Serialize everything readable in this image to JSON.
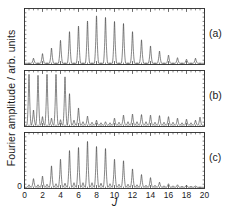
{
  "figure": {
    "ylabel": "Fourier amplitude / arb. units",
    "xlabel": "J",
    "panel_tags": [
      "(a)",
      "(b)",
      "(c)"
    ]
  },
  "chart_data": {
    "type": "line",
    "title": "",
    "xlabel": "J",
    "ylabel": "Fourier amplitude / arb. units",
    "xlim": [
      0,
      20
    ],
    "xticks": [
      0,
      2,
      4,
      6,
      8,
      10,
      12,
      14,
      16,
      18,
      20
    ],
    "xtick_labels": [
      "0",
      "2",
      "4",
      "6",
      "8",
      "10",
      "12",
      "14",
      "16",
      "18",
      "20"
    ],
    "xminor_tick_interval": 0.5,
    "ylim": [
      0,
      1
    ],
    "yticks_visible": false,
    "grid": false,
    "legend": false,
    "tick_direction": "in",
    "line_color": "#3a3a3a",
    "frame_color": "#2b2b2b",
    "background": "#ffffff",
    "peak_half_width": 0.075,
    "panels": [
      {
        "label": "(a)",
        "description": "Bell-shaped rotational distribution peaking near J=8-9, tall narrow peaks at integer J.",
        "x": [
          1,
          2,
          3,
          4,
          5,
          6,
          7,
          8,
          9,
          10,
          11,
          12,
          13,
          14,
          15,
          16,
          17,
          18,
          19
        ],
        "values": [
          0.1,
          0.19,
          0.3,
          0.45,
          0.62,
          0.73,
          0.83,
          0.93,
          0.9,
          0.82,
          0.78,
          0.62,
          0.46,
          0.34,
          0.24,
          0.16,
          0.11,
          0.08,
          0.1
        ]
      },
      {
        "label": "(b)",
        "description": "Intensity concentrated at low J with saturated peaks for J=0.5 to 4.5, weak dense comb at high J.",
        "x": [
          0.5,
          1.0,
          1.5,
          2.0,
          2.5,
          3.0,
          3.5,
          4.0,
          4.5,
          5.0,
          5.5,
          6.0,
          6.5,
          7.0,
          7.5,
          8.0,
          8.5,
          9.0,
          9.5,
          10.0,
          10.5,
          11.0,
          11.5,
          12.0,
          12.5,
          13.0,
          13.5,
          14.0,
          14.5,
          15.0,
          15.5,
          16.0,
          16.5,
          17.0,
          17.5,
          18.0,
          18.5,
          19.0,
          19.5
        ],
        "values": [
          1.0,
          0.3,
          0.98,
          0.17,
          1.0,
          0.14,
          1.0,
          0.11,
          0.95,
          0.62,
          0.1,
          0.34,
          0.07,
          0.18,
          0.06,
          0.1,
          0.05,
          0.07,
          0.05,
          0.14,
          0.06,
          0.2,
          0.07,
          0.22,
          0.07,
          0.21,
          0.07,
          0.2,
          0.06,
          0.19,
          0.06,
          0.17,
          0.06,
          0.14,
          0.05,
          0.12,
          0.05,
          0.1,
          0.16
        ]
      },
      {
        "label": "(c)",
        "description": "Bell-shaped distribution peaking near J=7, strong peaks at integer J with weak satellites at half-integer J.",
        "x": [
          0.5,
          1.0,
          1.5,
          2.0,
          2.5,
          3.0,
          3.5,
          4.0,
          4.5,
          5.0,
          5.5,
          6.0,
          6.5,
          7.0,
          7.5,
          8.0,
          8.5,
          9.0,
          9.5,
          10.0,
          10.5,
          11.0,
          11.5,
          12.0,
          12.5,
          13.0,
          13.5,
          14.0,
          14.5,
          15.0,
          15.5,
          16.0,
          16.5,
          17.0,
          17.5,
          18.0,
          18.5,
          19.0
        ],
        "values": [
          0.05,
          0.17,
          0.05,
          0.22,
          0.06,
          0.42,
          0.07,
          0.55,
          0.08,
          0.72,
          0.09,
          0.78,
          0.09,
          0.9,
          0.09,
          0.8,
          0.08,
          0.76,
          0.07,
          0.55,
          0.06,
          0.52,
          0.06,
          0.36,
          0.05,
          0.25,
          0.04,
          0.19,
          0.04,
          0.1,
          0.03,
          0.07,
          0.03,
          0.05,
          0.02,
          0.04,
          0.02,
          0.03
        ]
      }
    ]
  }
}
